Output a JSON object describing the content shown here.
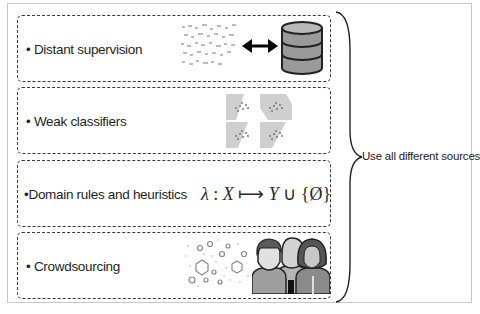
{
  "diagram": {
    "boxes": [
      {
        "label": "• Distant supervision",
        "illustration": "scattered-text-to-database"
      },
      {
        "label": "• Weak classifiers",
        "illustration": "four-scatter-plot-grid"
      },
      {
        "label": "•Domain rules and heuristics",
        "formula": {
          "lambda": "λ",
          "colon": " : ",
          "x": "X",
          "arrow": " ⟼ ",
          "y": "Y",
          "union": " ∪ ",
          "set": "{Ø}"
        }
      },
      {
        "label": "• Crowdsourcing",
        "illustration": "network-and-people"
      }
    ],
    "brace_label": "Use all different sources"
  },
  "colors": {
    "border": "#3a3a3a",
    "frame": "#c8c8c8",
    "db_fill": "#9a9a9a",
    "plot_bg": "#c4c4c4"
  }
}
